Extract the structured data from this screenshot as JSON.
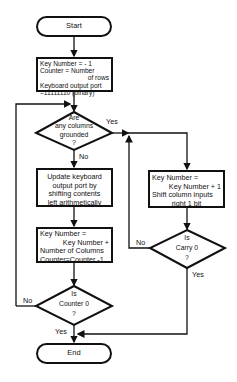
{
  "flowchart": {
    "start": "Start",
    "end": "End",
    "init_box": {
      "lines": [
        "Key Number = - 1",
        "Counter = Number",
        "of rows",
        "Keyboard output port",
        "=11111110 (binary)"
      ]
    },
    "decision_grounded": {
      "lines": [
        "Are",
        "any columns",
        "grounded",
        "?"
      ],
      "yes": "Yes",
      "no": "No"
    },
    "update_box": {
      "lines": [
        "Update keyboard",
        "output port by",
        "shifting contents",
        "left arithmetically"
      ]
    },
    "keynum_box": {
      "lines": [
        "Key Number =",
        "Key Number +",
        "Number of Columns",
        "Counter=Counter -1"
      ]
    },
    "decision_counter": {
      "lines": [
        "Is",
        "Counter 0",
        "?"
      ],
      "yes": "Yes",
      "no": "No"
    },
    "shift_box": {
      "lines": [
        "Key Number =",
        "Key Number + 1",
        "Shift column inputs",
        "right 1 bit"
      ]
    },
    "decision_carry": {
      "lines": [
        "Is",
        "Carry 0",
        "?"
      ],
      "yes": "Yes",
      "no": "No"
    }
  }
}
